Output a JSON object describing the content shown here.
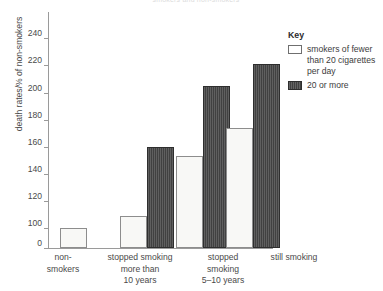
{
  "chart_data": {
    "type": "bar",
    "title": "smokers and non-smokers",
    "xlabel": "",
    "ylabel": "death rates/% of non-smokers",
    "ylim": [
      0,
      240
    ],
    "y_ticks": [
      0,
      100,
      120,
      140,
      160,
      180,
      200,
      220,
      240
    ],
    "y_tick_labels": [
      "0",
      "100",
      "120",
      "140",
      "160",
      "180",
      "200",
      "220",
      "240"
    ],
    "axis_break": true,
    "axis_break_note": "y-axis is broken between 0 and 100",
    "grid": false,
    "legend_position": "right",
    "legend_title": "Key",
    "categories": [
      "non-smokers",
      "stopped smoking more than 10 years",
      "stopped smoking 5-10 years",
      "still smoking"
    ],
    "category_labels": [
      [
        "non-",
        "smokers"
      ],
      [
        "stopped smoking",
        "more than",
        "10 years"
      ],
      [
        "stopped",
        "smoking",
        "5–10 years"
      ],
      [
        "still smoking"
      ]
    ],
    "series": [
      {
        "name": "smokers of fewer than 20 cigarettes per day",
        "color": "#f8f8f6",
        "values": [
          100,
          109,
          153,
          174
        ]
      },
      {
        "name": "20 or more",
        "color": "#414141",
        "values": [
          null,
          160,
          205,
          221
        ]
      }
    ]
  },
  "legend": {
    "title": "Key",
    "entries": [
      {
        "label": "smokers of fewer than 20 cigarettes per day",
        "swatch": "light-swatch-icon"
      },
      {
        "label": "20 or more",
        "swatch": "dark-hatched-swatch-icon"
      }
    ]
  },
  "colors": {
    "light_bar_fill": "#f8f8f6",
    "light_bar_stroke": "#8d8d8d",
    "dark_bar_fill": "#414141",
    "axis": "#9a9a9a",
    "text": "#4a4a4a"
  }
}
